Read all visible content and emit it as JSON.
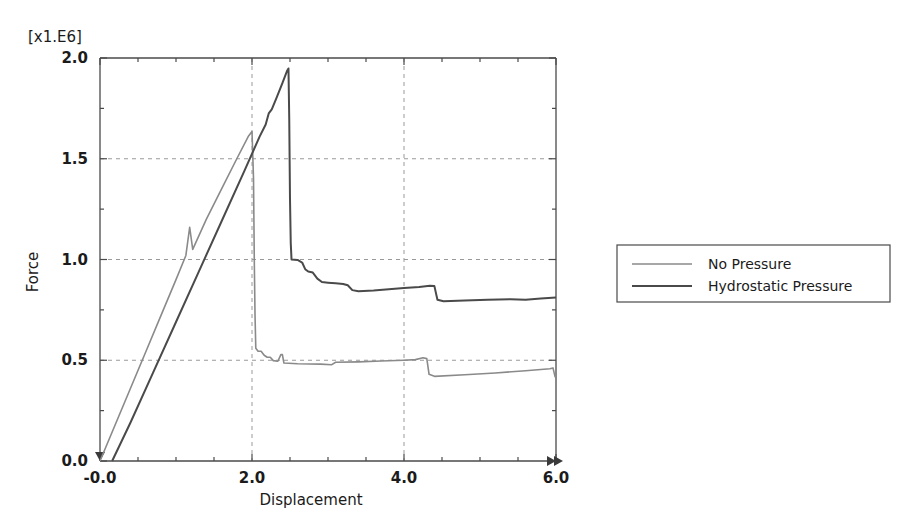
{
  "chart_data": {
    "type": "line",
    "title": "",
    "subtitle": "",
    "scale_note": "[x1.E6]",
    "xlabel": "Displacement",
    "ylabel": "Force",
    "xlim": [
      -0.0,
      6.0
    ],
    "ylim": [
      0.0,
      2.0
    ],
    "xticks": [
      -0.0,
      2.0,
      4.0,
      6.0
    ],
    "xticklabels": [
      "-0.0",
      "2.0",
      "4.0",
      "6.0"
    ],
    "yticks": [
      0.0,
      0.5,
      1.0,
      1.5,
      2.0
    ],
    "yticklabels": [
      "0.0",
      "0.5",
      "1.0",
      "1.5",
      "2.0"
    ],
    "xminorticks": [
      0.5,
      1.0,
      1.5,
      2.5,
      3.0,
      3.5,
      4.5,
      5.0,
      5.5
    ],
    "yminorticks": [
      0.25,
      0.75,
      1.25,
      1.75
    ],
    "grid": true,
    "grid_x": [
      2.0,
      4.0
    ],
    "grid_y": [
      0.5,
      1.0,
      1.5
    ],
    "legend_position": "right-outside",
    "series": [
      {
        "name": "No Pressure",
        "color": "#8a8a8a",
        "width": 1.6,
        "points": [
          [
            0.0,
            0.0
          ],
          [
            0.2,
            0.18
          ],
          [
            0.4,
            0.36
          ],
          [
            0.6,
            0.54
          ],
          [
            0.8,
            0.72
          ],
          [
            1.0,
            0.9
          ],
          [
            1.13,
            1.02
          ],
          [
            1.18,
            1.16
          ],
          [
            1.22,
            1.05
          ],
          [
            1.4,
            1.2
          ],
          [
            1.6,
            1.35
          ],
          [
            1.8,
            1.5
          ],
          [
            1.95,
            1.61
          ],
          [
            2.0,
            1.635
          ],
          [
            2.02,
            1.4
          ],
          [
            2.03,
            1.0
          ],
          [
            2.04,
            0.72
          ],
          [
            2.05,
            0.56
          ],
          [
            2.08,
            0.545
          ],
          [
            2.12,
            0.545
          ],
          [
            2.16,
            0.525
          ],
          [
            2.2,
            0.515
          ],
          [
            2.24,
            0.515
          ],
          [
            2.28,
            0.498
          ],
          [
            2.34,
            0.495
          ],
          [
            2.38,
            0.528
          ],
          [
            2.4,
            0.528
          ],
          [
            2.42,
            0.486
          ],
          [
            2.6,
            0.483
          ],
          [
            2.9,
            0.481
          ],
          [
            3.05,
            0.478
          ],
          [
            3.1,
            0.49
          ],
          [
            3.4,
            0.492
          ],
          [
            3.7,
            0.496
          ],
          [
            4.0,
            0.5
          ],
          [
            4.15,
            0.503
          ],
          [
            4.25,
            0.512
          ],
          [
            4.3,
            0.508
          ],
          [
            4.33,
            0.43
          ],
          [
            4.4,
            0.42
          ],
          [
            4.8,
            0.428
          ],
          [
            5.2,
            0.437
          ],
          [
            5.6,
            0.448
          ],
          [
            5.92,
            0.458
          ],
          [
            5.96,
            0.462
          ],
          [
            5.99,
            0.415
          ]
        ]
      },
      {
        "name": "Hydrostatic Pressure",
        "color": "#4a4a4a",
        "width": 2.0,
        "points": [
          [
            0.16,
            0.0
          ],
          [
            0.4,
            0.19
          ],
          [
            0.7,
            0.44
          ],
          [
            1.0,
            0.69
          ],
          [
            1.3,
            0.94
          ],
          [
            1.6,
            1.19
          ],
          [
            1.9,
            1.44
          ],
          [
            2.1,
            1.61
          ],
          [
            2.18,
            1.67
          ],
          [
            2.22,
            1.725
          ],
          [
            2.26,
            1.745
          ],
          [
            2.32,
            1.8
          ],
          [
            2.4,
            1.875
          ],
          [
            2.46,
            1.935
          ],
          [
            2.48,
            1.948
          ],
          [
            2.49,
            1.7
          ],
          [
            2.5,
            1.3
          ],
          [
            2.51,
            1.08
          ],
          [
            2.52,
            1.0
          ],
          [
            2.6,
            0.998
          ],
          [
            2.66,
            0.985
          ],
          [
            2.7,
            0.952
          ],
          [
            2.74,
            0.94
          ],
          [
            2.8,
            0.935
          ],
          [
            2.86,
            0.905
          ],
          [
            2.92,
            0.888
          ],
          [
            3.0,
            0.885
          ],
          [
            3.1,
            0.882
          ],
          [
            3.2,
            0.878
          ],
          [
            3.26,
            0.872
          ],
          [
            3.32,
            0.848
          ],
          [
            3.4,
            0.843
          ],
          [
            3.6,
            0.846
          ],
          [
            3.8,
            0.852
          ],
          [
            4.0,
            0.858
          ],
          [
            4.2,
            0.864
          ],
          [
            4.34,
            0.87
          ],
          [
            4.4,
            0.868
          ],
          [
            4.44,
            0.8
          ],
          [
            4.52,
            0.793
          ],
          [
            4.8,
            0.796
          ],
          [
            5.1,
            0.8
          ],
          [
            5.4,
            0.803
          ],
          [
            5.6,
            0.8
          ],
          [
            5.8,
            0.806
          ],
          [
            6.0,
            0.812
          ]
        ]
      }
    ]
  },
  "legend": {
    "entries": [
      {
        "label": "No Pressure"
      },
      {
        "label": "Hydrostatic Pressure"
      }
    ]
  },
  "axes": {
    "x_axis_name": "Displacement",
    "y_axis_name": "Force",
    "scale_multiplier": "[x1.E6]"
  }
}
